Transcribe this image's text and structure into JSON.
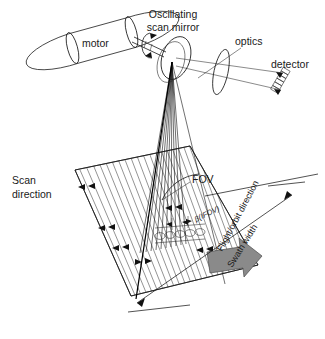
{
  "figure": {
    "name": "whiskbroom-scanner-geometry",
    "background_color": "#ffffff",
    "ink_color": "#1a1a1a",
    "arrow_fill_color": "#8a8a8a",
    "arrow_stroke_color": "#4a4a4a"
  },
  "labels": {
    "motor": "motor",
    "oscillating_line1": "Oscillating",
    "oscillating_line2": "scan mirror",
    "optics": "optics",
    "detector": "detector",
    "scan_direction_line1": "Scan",
    "scan_direction_line2": "direction",
    "fov": "FOV",
    "ifov": "β(IFOV)",
    "flight_direction": "Flight/orbit direction",
    "swath_width": "Swath width"
  },
  "components": {
    "motor_body": "motor-cylinder",
    "motor_shaft": "drive-shaft",
    "rotation_indicator": "oscillation-arrow",
    "mirror": "oscillating-scan-mirror-ellipse",
    "lens": "optics-lens-ellipse",
    "detector_array": "linear-detector-array",
    "ground_swath": "hatched-ground-swath",
    "pixel_cells": "ground-resolution-cells",
    "ray_fan": "scan-ray-fan",
    "flight_arrow": "flight-direction-arrow",
    "swath_dimension": "swath-width-dimension-arrow",
    "fov_arc": "field-of-view-arc",
    "ifov_marker": "instantaneous-fov-marker"
  },
  "geometry": {
    "mirror_center_x": 172,
    "mirror_center_y": 62,
    "ground_target_x": 168,
    "ground_target_y": 248,
    "fov_label_x": 196,
    "fov_label_y": 178,
    "swath_width_angle_deg": 62,
    "flight_direction_angle_deg": -62
  }
}
